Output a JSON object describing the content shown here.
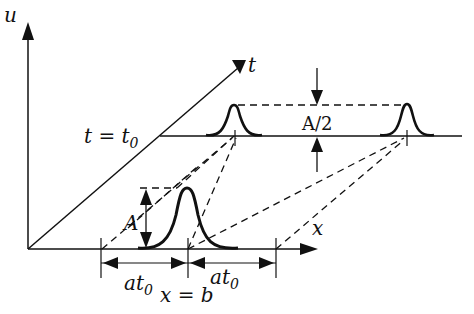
{
  "diagram": {
    "axes": {
      "u_label": "u",
      "t_label": "t",
      "x_label": "x"
    },
    "time_line_label": "t = t",
    "time_line_subscript": "0",
    "amplitude_label_initial": "A",
    "amplitude_label_later": "A/2",
    "distance_left": {
      "main": "at",
      "sub": "0"
    },
    "distance_right": {
      "main": "at",
      "sub": "0"
    },
    "position_label": "x = b",
    "colors": {
      "ink": "#111111",
      "background": "#ffffff"
    }
  }
}
